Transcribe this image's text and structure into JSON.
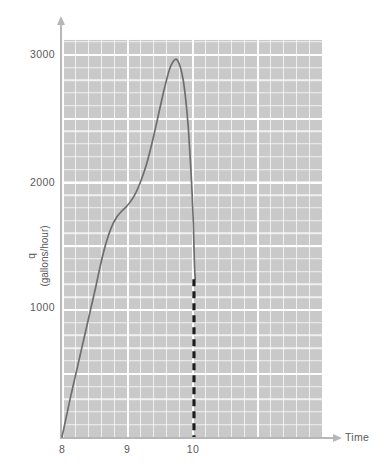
{
  "chart_data": {
    "type": "line",
    "title": "",
    "xlabel": "Time",
    "ylabel": "q (gallons/hour)",
    "ylabel_symbol": "q",
    "ylabel_units": "(gallons/hour)",
    "xlim": [
      8,
      12
    ],
    "ylim": [
      0,
      3160
    ],
    "grid": true,
    "grid_major_x_step": 1,
    "grid_minor_x_step": 0.2,
    "grid_major_y_step": 500,
    "grid_minor_y_step": 100,
    "legend": "none",
    "x_ticks": [
      {
        "label": "8",
        "value": 8
      },
      {
        "label": "9",
        "value": 9
      },
      {
        "label": "10",
        "value": 10
      }
    ],
    "y_ticks": [
      {
        "label": "1000",
        "value": 1000
      },
      {
        "label": "2000",
        "value": 2000
      },
      {
        "label": "3000",
        "value": 3000
      }
    ],
    "series": [
      {
        "name": "q",
        "style": "solid",
        "color": "#6e6e70",
        "points": [
          [
            8.0,
            0
          ],
          [
            8.05,
            120
          ],
          [
            8.12,
            290
          ],
          [
            8.2,
            470
          ],
          [
            8.28,
            650
          ],
          [
            8.36,
            830
          ],
          [
            8.44,
            1010
          ],
          [
            8.52,
            1190
          ],
          [
            8.6,
            1380
          ],
          [
            8.68,
            1540
          ],
          [
            8.76,
            1660
          ],
          [
            8.84,
            1740
          ],
          [
            8.92,
            1790
          ],
          [
            9.0,
            1830
          ],
          [
            9.1,
            1900
          ],
          [
            9.2,
            2010
          ],
          [
            9.3,
            2160
          ],
          [
            9.4,
            2360
          ],
          [
            9.5,
            2590
          ],
          [
            9.58,
            2770
          ],
          [
            9.66,
            2920
          ],
          [
            9.74,
            2990
          ],
          [
            9.8,
            2960
          ],
          [
            9.86,
            2840
          ],
          [
            9.9,
            2690
          ],
          [
            9.94,
            2470
          ],
          [
            9.97,
            2230
          ],
          [
            10.0,
            1950
          ],
          [
            10.02,
            1700
          ],
          [
            10.03,
            1500
          ],
          [
            10.04,
            1340
          ],
          [
            10.05,
            1250
          ]
        ]
      }
    ],
    "annotations": [
      {
        "type": "vertical-dashed-line",
        "name": "shutdown-marker",
        "x": 10.03,
        "y_from": 0,
        "y_to": 1250,
        "color": "#1c1c1c",
        "style": "dashed"
      }
    ]
  }
}
